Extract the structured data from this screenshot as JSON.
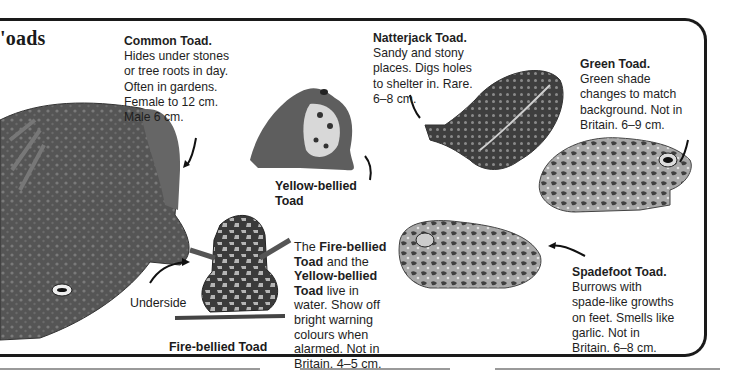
{
  "page": {
    "title_visible": "'oads"
  },
  "species": [
    {
      "id": "common",
      "name": "Common Toad.",
      "lines": [
        "Hides under stones",
        "or tree roots in day.",
        "Often in gardens.",
        "Female to 12 cm.",
        "Male 6 cm."
      ]
    },
    {
      "id": "natterjack",
      "name": "Natterjack Toad.",
      "lines": [
        "Sandy and stony",
        "places. Digs holes",
        "to shelter in. Rare.",
        "6–8 cm."
      ]
    },
    {
      "id": "green",
      "name": "Green Toad.",
      "lines": [
        "Green shade",
        "changes to match",
        "background. Not in",
        "Britain. 6–9 cm."
      ]
    },
    {
      "id": "yellow-bellied",
      "name_lines": [
        "Yellow-bellied",
        "Toad"
      ]
    },
    {
      "id": "fire-bellied",
      "name": "Fire-bellied Toad",
      "underside_label": "Underside"
    },
    {
      "id": "spadefoot",
      "name": "Spadefoot Toad.",
      "lines": [
        "Burrows with",
        "spade-like growths",
        "on feet. Smells like",
        "garlic. Not in",
        "Britain. 6–8 cm."
      ]
    }
  ],
  "shared_note": {
    "lines": [
      {
        "pre": "The ",
        "bold": "Fire-bellied",
        "post": ""
      },
      {
        "pre": "",
        "bold": "Toad",
        "post": " and the"
      },
      {
        "pre": "",
        "bold": "Yellow-bellied",
        "post": ""
      },
      {
        "pre": "",
        "bold": "Toad",
        "post": " live in"
      },
      {
        "pre": "water. Show off",
        "bold": "",
        "post": ""
      },
      {
        "pre": "bright warning",
        "bold": "",
        "post": ""
      },
      {
        "pre": "colours when",
        "bold": "",
        "post": ""
      },
      {
        "pre": "alarmed. Not in",
        "bold": "",
        "post": ""
      },
      {
        "pre": "Britain. 4–5 cm.",
        "bold": "",
        "post": ""
      }
    ]
  },
  "colors": {
    "border": "#1a1a1a",
    "toad_dark": "#4a4a4a",
    "toad_mid": "#6e6e6e",
    "toad_light": "#b8b8b8"
  }
}
